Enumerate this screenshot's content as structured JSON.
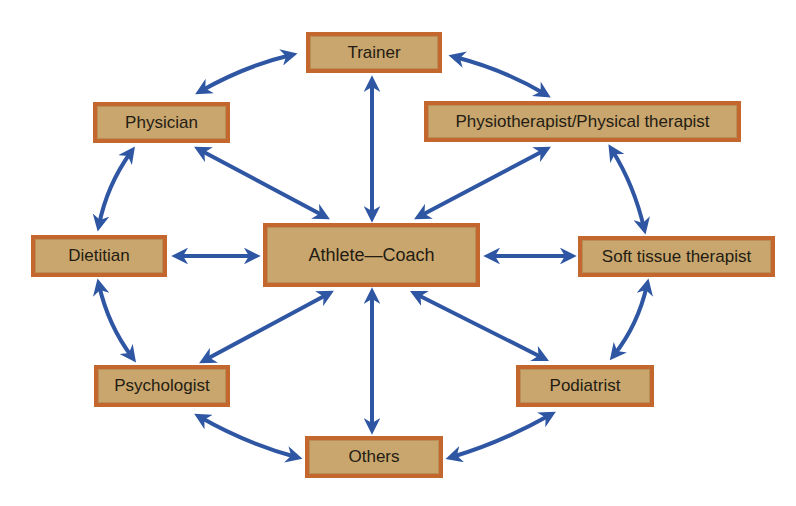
{
  "diagram": {
    "center": {
      "id": "center",
      "label": "Athlete—Coach"
    },
    "nodes": [
      {
        "id": "trainer",
        "label": "Trainer"
      },
      {
        "id": "physician",
        "label": "Physician"
      },
      {
        "id": "physio",
        "label": "Physiotherapist/Physical therapist"
      },
      {
        "id": "dietitian",
        "label": "Dietitian"
      },
      {
        "id": "softtissue",
        "label": "Soft tissue therapist"
      },
      {
        "id": "psychologist",
        "label": "Psychologist"
      },
      {
        "id": "podiatrist",
        "label": "Podiatrist"
      },
      {
        "id": "others",
        "label": "Others"
      }
    ],
    "edges": [
      {
        "from": "center",
        "to": "trainer",
        "type": "bidirectional"
      },
      {
        "from": "center",
        "to": "physician",
        "type": "bidirectional"
      },
      {
        "from": "center",
        "to": "physio",
        "type": "bidirectional"
      },
      {
        "from": "center",
        "to": "dietitian",
        "type": "bidirectional"
      },
      {
        "from": "center",
        "to": "softtissue",
        "type": "bidirectional"
      },
      {
        "from": "center",
        "to": "psychologist",
        "type": "bidirectional"
      },
      {
        "from": "center",
        "to": "podiatrist",
        "type": "bidirectional"
      },
      {
        "from": "center",
        "to": "others",
        "type": "bidirectional"
      },
      {
        "from": "trainer",
        "to": "physician",
        "type": "bidirectional"
      },
      {
        "from": "trainer",
        "to": "physio",
        "type": "bidirectional"
      },
      {
        "from": "physician",
        "to": "dietitian",
        "type": "bidirectional"
      },
      {
        "from": "physio",
        "to": "softtissue",
        "type": "bidirectional"
      },
      {
        "from": "dietitian",
        "to": "psychologist",
        "type": "bidirectional"
      },
      {
        "from": "softtissue",
        "to": "podiatrist",
        "type": "bidirectional"
      },
      {
        "from": "psychologist",
        "to": "others",
        "type": "bidirectional"
      },
      {
        "from": "podiatrist",
        "to": "others",
        "type": "bidirectional"
      }
    ],
    "colors": {
      "box_fill": "#c9a66e",
      "box_border": "#c4672f",
      "arrow": "#2f56a3",
      "text": "#231c12"
    }
  }
}
